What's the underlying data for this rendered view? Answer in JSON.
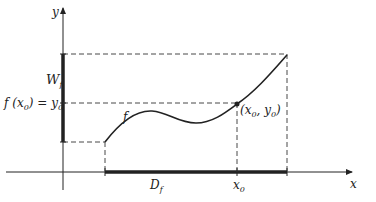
{
  "diagram": {
    "type": "function-domain-range",
    "axes": {
      "x_label": "x",
      "y_label": "y"
    },
    "labels": {
      "range": "W",
      "range_sub": "f",
      "fx0_lhs": "f (x",
      "fx0_sub": "0",
      "fx0_rhs": ") = y",
      "fx0_sub2": "0",
      "curve": "f",
      "point": "(x",
      "point_sub1": "0",
      "point_mid": ", y",
      "point_sub2": "0",
      "point_end": ")",
      "domain": "D",
      "domain_sub": "f",
      "x0": "x",
      "x0_sub": "0"
    },
    "colors": {
      "ink": "#222222",
      "background": "#ffffff"
    }
  }
}
